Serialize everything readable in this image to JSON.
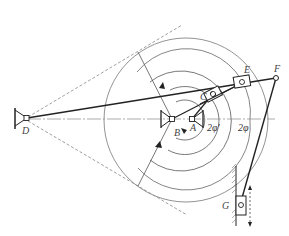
{
  "figure": {
    "type": "mechanism-diagram",
    "line_color": "#222222",
    "aux_color": "#777777",
    "background": "#ffffff"
  },
  "labels": {
    "D": "D",
    "B": "B",
    "A": "A",
    "C": "C",
    "E": "E",
    "F": "F",
    "G": "G",
    "angle_inner": "2φ'",
    "angle_outer": "2φ"
  }
}
